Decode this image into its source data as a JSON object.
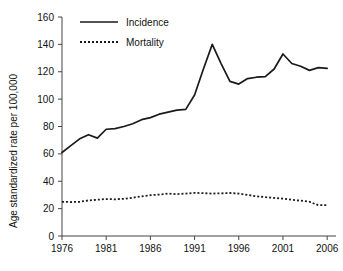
{
  "chart_data": {
    "type": "line",
    "title": "",
    "xlabel": "",
    "ylabel": "Age standardized rate per 100,000",
    "xlim": [
      1976,
      2007
    ],
    "ylim": [
      0,
      160
    ],
    "grid": false,
    "legend_position": "top-left",
    "xticks": [
      1976,
      1981,
      1986,
      1991,
      1996,
      2001,
      2006
    ],
    "xtick_labels": [
      "1976",
      "1981",
      "1986",
      "1991",
      "1996",
      "2001",
      "2006"
    ],
    "yticks": [
      0,
      20,
      40,
      60,
      80,
      100,
      120,
      140,
      160
    ],
    "ytick_labels": [
      "0",
      "20",
      "40",
      "60",
      "80",
      "100",
      "120",
      "140",
      "160"
    ],
    "x": [
      1976,
      1977,
      1978,
      1979,
      1980,
      1981,
      1982,
      1983,
      1984,
      1985,
      1986,
      1987,
      1988,
      1989,
      1990,
      1991,
      1992,
      1993,
      1994,
      1995,
      1996,
      1997,
      1998,
      1999,
      2000,
      2001,
      2002,
      2003,
      2004,
      2005,
      2006
    ],
    "series": [
      {
        "name": "Incidence",
        "style": "solid",
        "values": [
          61,
          66,
          71,
          74,
          71.5,
          78,
          78.5,
          80,
          82,
          85,
          86.5,
          89,
          90.5,
          92,
          92.5,
          103,
          122,
          140,
          126,
          113,
          111,
          115,
          116,
          116.5,
          122,
          133,
          126,
          124,
          121,
          123,
          122.5
        ]
      },
      {
        "name": "Mortality",
        "style": "dashed",
        "values": [
          25,
          24.8,
          25,
          26,
          26.5,
          27,
          26.8,
          27.2,
          28,
          29,
          29.8,
          30.3,
          31,
          30.6,
          31,
          31.5,
          31.3,
          31,
          31.2,
          31.4,
          31,
          30,
          29,
          28.4,
          27.8,
          27.3,
          26.5,
          25.8,
          25,
          22.5,
          22.5
        ]
      }
    ],
    "incidence_last_x": 2006,
    "incidence_last_y": 126,
    "mortality_last_x": 2005,
    "mortality_last_y": 22.5
  },
  "legend": {
    "items": [
      {
        "label": "Incidence",
        "style": "solid"
      },
      {
        "label": "Mortality",
        "style": "dashed"
      }
    ]
  }
}
